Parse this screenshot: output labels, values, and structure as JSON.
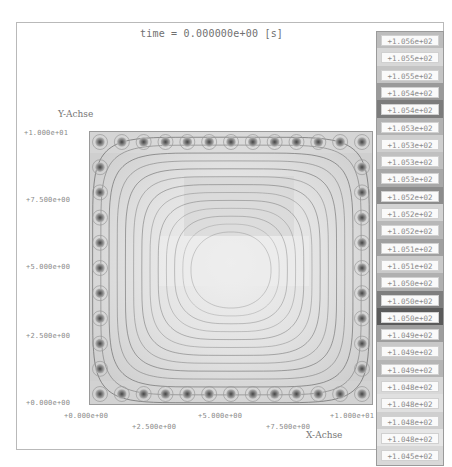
{
  "chart_data": {
    "type": "heatmap",
    "subtype": "contour field with probe markers",
    "title": "time = 0.000000e+00 [s]",
    "xlabel": "X-Achse",
    "ylabel": "Y-Achse",
    "xlim": [
      0,
      10
    ],
    "ylim": [
      0,
      10
    ],
    "x_ticks": [
      "+0.000e+00",
      "+2.500e+00",
      "+5.000e+00",
      "+7.500e+00",
      "+1.000e+01"
    ],
    "y_ticks": [
      "+0.000e+00",
      "+2.500e+00",
      "+5.000e+00",
      "+7.500e+00",
      "+1.000e+01"
    ],
    "grid": false,
    "legend_position": "right",
    "colorscale": "grayscale",
    "legend_entries": [
      "+1.056e+02",
      "+1.055e+02",
      "+1.055e+02",
      "+1.054e+02",
      "+1.054e+02",
      "+1.053e+02",
      "+1.053e+02",
      "+1.053e+02",
      "+1.053e+02",
      "+1.052e+02",
      "+1.052e+02",
      "+1.052e+02",
      "+1.051e+02",
      "+1.051e+02",
      "+1.050e+02",
      "+1.050e+02",
      "+1.050e+02",
      "+1.049e+02",
      "+1.049e+02",
      "+1.049e+02",
      "+1.048e+02",
      "+1.048e+02",
      "+1.048e+02",
      "+1.048e+02",
      "+1.045e+02"
    ],
    "legend_swatch_colors": [
      "#bdbdbd",
      "#d7d7d7",
      "#c4c4c4",
      "#9a9a9a",
      "#7c7c7c",
      "#b2b2b2",
      "#cfcfcf",
      "#c0c0c0",
      "#a8a8a8",
      "#8c8c8c",
      "#d3d3d3",
      "#b8b8b8",
      "#a0a0a0",
      "#c9c9c9",
      "#b0b0b0",
      "#7e7e7e",
      "#5a5a5a",
      "#9e9e9e",
      "#c8c8c8",
      "#b5b5b5",
      "#d8d8d8",
      "#e0e0e0",
      "#cfcfcf",
      "#e6e6e6",
      "#d8d8d8"
    ],
    "value_range": [
      104.5,
      105.6
    ],
    "probe_grid": {
      "top_row_count": 13,
      "bottom_row_count": 13,
      "left_column_count": 11,
      "right_column_count": 11
    },
    "contour_count": 13
  }
}
